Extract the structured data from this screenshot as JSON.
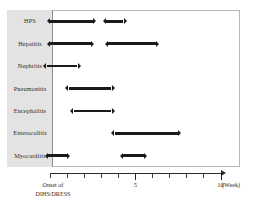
{
  "chart_data": {
    "type": "bar",
    "title": "",
    "xlabel": "(Week)",
    "ylabel": "",
    "xlim": [
      0,
      10.2
    ],
    "grid": false,
    "legend": null,
    "origin_label_line1": "Onset of",
    "origin_label_line2": "DIHS/DRESS",
    "unit_label": "(Week)",
    "xticks": [
      0,
      1,
      2,
      3,
      4,
      5,
      6,
      7,
      8,
      9,
      10
    ],
    "xtick_labels": [
      "",
      "",
      "",
      "",
      "",
      "5",
      "",
      "",
      "",
      "",
      "10"
    ],
    "categories": [
      "HPS",
      "Hepatitis",
      "Nephritis",
      "Pneumonitis",
      "Encephalitis",
      "Enterocolitis",
      "Myocarditis"
    ],
    "series": [
      {
        "name": "HPS",
        "intervals": [
          {
            "start": 0.0,
            "end": 2.5
          },
          {
            "start": 3.3,
            "end": 4.3
          }
        ]
      },
      {
        "name": "Hepatitis",
        "intervals": [
          {
            "start": 0.0,
            "end": 2.4
          },
          {
            "start": 3.4,
            "end": 6.2
          }
        ]
      },
      {
        "name": "Nephritis",
        "intervals": [
          {
            "start": -0.2,
            "end": 1.6
          }
        ]
      },
      {
        "name": "Pneumonitis",
        "intervals": [
          {
            "start": 1.1,
            "end": 3.6
          }
        ]
      },
      {
        "name": "Encephalitis",
        "intervals": [
          {
            "start": 1.4,
            "end": 3.6
          }
        ]
      },
      {
        "name": "Enterocolitis",
        "intervals": [
          {
            "start": 3.8,
            "end": 7.5
          }
        ]
      },
      {
        "name": "Myocarditis",
        "intervals": [
          {
            "start": -0.1,
            "end": 1.0
          },
          {
            "start": 4.3,
            "end": 5.5
          }
        ]
      }
    ],
    "colors": {
      "bar": "#1a1a1a",
      "axis": "#2a2a2a",
      "label_column_background": "#e3e3e3",
      "plot_border": "#b9b9b9"
    }
  }
}
